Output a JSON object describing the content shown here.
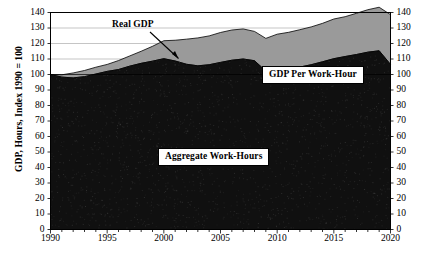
{
  "chart_data": {
    "type": "area",
    "title": "",
    "subtitle": "",
    "xlabel": "",
    "ylabel": "GDP, Hours, Index 1990 = 100",
    "xlim": [
      1990,
      2020
    ],
    "ylim": [
      0,
      140
    ],
    "ytick_step": 10,
    "xtick_step": 5,
    "grid": true,
    "stacked": true,
    "legend_position": "inline-annotations",
    "y_ticks": [
      0,
      10,
      20,
      30,
      40,
      50,
      60,
      70,
      80,
      90,
      100,
      110,
      120,
      130,
      140
    ],
    "x_ticks": [
      1990,
      1995,
      2000,
      2005,
      2010,
      2015,
      2020
    ],
    "x_minor_tick_step": 1,
    "y_axis_left_labels": [
      "0",
      "10",
      "20",
      "30",
      "40",
      "50",
      "60",
      "70",
      "80",
      "90",
      "100",
      "110",
      "120",
      "130",
      "140"
    ],
    "y_axis_right_labels": [
      "0",
      "10",
      "20",
      "30",
      "40",
      "50",
      "60",
      "70",
      "80",
      "90",
      "100",
      "110",
      "120",
      "130",
      "140"
    ],
    "x": [
      1990,
      1991,
      1992,
      1993,
      1994,
      1995,
      1996,
      1997,
      1998,
      1999,
      2000,
      2001,
      2002,
      2003,
      2004,
      2005,
      2006,
      2007,
      2008,
      2009,
      2010,
      2011,
      2012,
      2013,
      2014,
      2015,
      2016,
      2017,
      2018,
      2019,
      2020
    ],
    "series": [
      {
        "name": "Aggregate Work-Hours",
        "color": "#101010",
        "stack_order": 1,
        "values": [
          100.0,
          98.3,
          97.8,
          98.6,
          100.3,
          102.0,
          103.2,
          105.4,
          107.2,
          108.6,
          110.2,
          108.7,
          106.6,
          105.6,
          106.3,
          107.8,
          109.2,
          110.0,
          108.9,
          102.2,
          102.0,
          103.3,
          104.8,
          106.3,
          108.2,
          110.2,
          111.6,
          112.9,
          114.4,
          115.3,
          106.5
        ]
      },
      {
        "name": "GDP Per Work-Hour",
        "color": "#9a9a9a",
        "stack_order": 2,
        "values": [
          0.0,
          1.5,
          3.2,
          4.0,
          4.4,
          4.5,
          5.8,
          6.6,
          7.8,
          9.6,
          11.6,
          13.4,
          16.2,
          18.0,
          18.6,
          19.3,
          19.5,
          19.4,
          18.9,
          21.1,
          24.0,
          23.9,
          24.1,
          24.4,
          24.8,
          25.6,
          25.7,
          26.6,
          27.4,
          28.1,
          32.1
        ]
      }
    ],
    "derived_series": [
      {
        "name": "Real GDP",
        "description": "Top boundary of stacked areas (Aggregate Work-Hours + GDP Per Work-Hour)",
        "values": [
          100.0,
          99.8,
          101.0,
          102.6,
          104.7,
          106.5,
          109.0,
          112.0,
          115.0,
          118.2,
          121.8,
          122.1,
          122.8,
          123.6,
          124.9,
          127.1,
          128.7,
          129.4,
          127.8,
          123.3,
          126.0,
          127.2,
          128.9,
          130.7,
          133.0,
          135.8,
          137.3,
          139.5,
          141.8,
          143.4,
          138.6
        ]
      }
    ],
    "annotations": [
      {
        "name": "real-gdp",
        "text": "Real GDP",
        "type": "arrow-label",
        "points_to_year": 2003
      },
      {
        "name": "gdp-per-work-hour",
        "text": "GDP Per Work-Hour",
        "type": "boxed-label"
      },
      {
        "name": "aggregate-work-hours",
        "text": "Aggregate Work-Hours",
        "type": "boxed-label"
      }
    ]
  },
  "labels": {
    "y_axis_title": "GDP, Hours, Index 1990 = 100",
    "real_gdp": "Real GDP",
    "gdp_per_work_hour": "GDP Per Work-Hour",
    "aggregate_work_hours": "Aggregate Work-Hours"
  },
  "colors": {
    "work_hours_fill": "#101010",
    "gdp_per_hour_fill": "#9a9a9a",
    "axis": "#000000",
    "grid": "#8a8a8a",
    "background": "#ffffff"
  }
}
